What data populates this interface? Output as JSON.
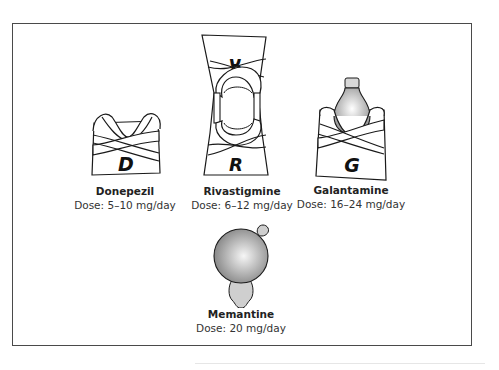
{
  "figure": {
    "drugs": [
      {
        "name": "Donepezil",
        "dose": "Dose: 5–10 mg/day",
        "letter": "D",
        "shape": "single-wrap-cup"
      },
      {
        "name": "Rivastigmine",
        "dose": "Dose: 6–12 mg/day",
        "letter": "R",
        "letter_mirrored": "R",
        "shape": "double-wrap-hourglass"
      },
      {
        "name": "Galantamine",
        "dose": "Dose: 16–24 mg/day",
        "letter": "G",
        "shape": "wrap-with-bulb"
      },
      {
        "name": "Memantine",
        "dose": "Dose: 20 mg/day",
        "shape": "sphere-with-stem"
      }
    ]
  },
  "colors": {
    "stroke": "#1a1a1a",
    "sphere_light": "#f4f4f4",
    "sphere_dark": "#8c8c8c",
    "stem_fill": "#cfcfcf"
  }
}
